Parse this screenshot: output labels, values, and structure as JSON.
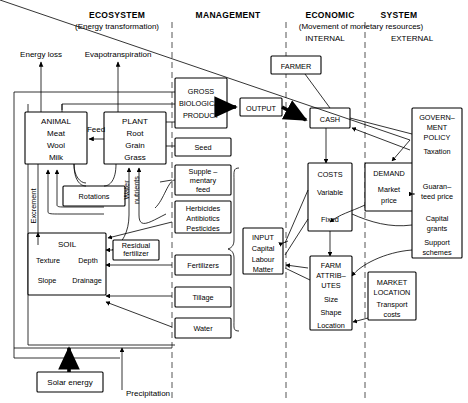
{
  "headers": {
    "ecosystem": {
      "title": "ECOSYSTEM",
      "subtitle": "(Energy transformation)"
    },
    "management": {
      "title": "MANAGEMENT"
    },
    "economic": {
      "title": "ECONOMIC",
      "title2": "SYSTEM",
      "subtitle": "(Movement of monetary resources)",
      "internal": "INTERNAL",
      "external": "EXTERNAL"
    }
  },
  "nodes": {
    "energy_loss": "Energy loss",
    "evapotranspiration": "Evapotranspiration",
    "animal": [
      "ANIMAL",
      "Meat",
      "Wool",
      "Milk"
    ],
    "plant": [
      "PLANT",
      "Root",
      "Grain",
      "Grass"
    ],
    "feed": "Feed",
    "rotations": "Rotations",
    "excrement": "Excrement",
    "water_nutrients": [
      "Water",
      "nutrients"
    ],
    "soil": [
      "SOIL",
      "Texture",
      "Depth",
      "Slope",
      "Drainage"
    ],
    "residual_fertilizer": [
      "Residual",
      "fertilizer"
    ],
    "solar_energy": "Solar energy",
    "precipitation": "Precipitation",
    "gross_biological_product": [
      "GROSS",
      "BIOLOGICAL",
      "PRODUCT"
    ],
    "seed": "Seed",
    "supplementary_feed": [
      "Supple –",
      "mentary",
      "feed"
    ],
    "herbicides": [
      "Herbicides",
      "Antibiotics",
      "Pesticides"
    ],
    "fertilizers": "Fertilizers",
    "tillage": "Tillage",
    "water": "Water",
    "input": [
      "INPUT",
      "Capital",
      "Labour",
      "Matter"
    ],
    "output": "OUTPUT",
    "farmer": "FARMER",
    "cash": "CASH",
    "costs": [
      "COSTS",
      "Variable",
      "Fixed"
    ],
    "farm_attributes": [
      "FARM",
      "ATTRIB–",
      "UTES",
      "Size",
      "Shape",
      "Location"
    ],
    "demand": [
      "DEMAND",
      "Market",
      "price"
    ],
    "market_location": [
      "MARKET",
      "LOCATION",
      "Transport",
      "costs"
    ],
    "government_policy": [
      "GOVERN–",
      "MENT",
      "POLICY",
      "Taxation",
      "Guaran–",
      "teed price",
      "Capital",
      "grants",
      "Support",
      "schemes"
    ]
  },
  "colors": {
    "ink": "#000000",
    "divider": "#555555",
    "paper": "#ffffff"
  }
}
